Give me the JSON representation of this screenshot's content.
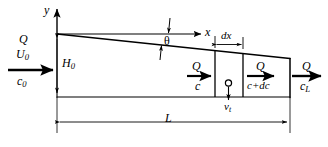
{
  "figure": {
    "type": "engineering-schematic",
    "axes": {
      "y_axis_label": "y",
      "x_axis_label": "x",
      "origin_description": "top-left corner of basin"
    },
    "labels": {
      "inlet_flow": "Q",
      "inlet_velocity": "U",
      "inlet_velocity_sub": "0",
      "inlet_concentration": "c",
      "inlet_concentration_sub": "0",
      "depth": "H",
      "depth_sub": "0",
      "angle": "θ",
      "element_width": "dx",
      "length": "L",
      "cv_in_flow": "Q",
      "cv_in_conc": "c",
      "cv_out_flow": "Q",
      "cv_out_conc": "c+dc",
      "outlet_flow": "Q",
      "outlet_concentration": "c",
      "outlet_concentration_sub": "L",
      "settling_velocity": "v",
      "settling_velocity_sub": "t"
    },
    "colors": {
      "line": "#000000",
      "background": "#ffffff",
      "text": "#000000"
    }
  }
}
